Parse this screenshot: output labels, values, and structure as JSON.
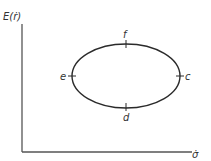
{
  "diagram": {
    "y_axis_label": "E(ṙ)",
    "x_axis_label": "σ̇",
    "curve": {
      "shape": "ellipse",
      "center": [
        126,
        76
      ],
      "rx": 54,
      "ry": 32,
      "stroke": "#2a2a2a"
    },
    "points": [
      {
        "id": "c",
        "label": "c",
        "position": "right"
      },
      {
        "id": "d",
        "label": "d",
        "position": "bottom"
      },
      {
        "id": "e",
        "label": "e",
        "position": "left"
      },
      {
        "id": "f",
        "label": "f",
        "position": "top"
      }
    ],
    "colors": {
      "axis": "#555555",
      "text": "#333333"
    }
  }
}
